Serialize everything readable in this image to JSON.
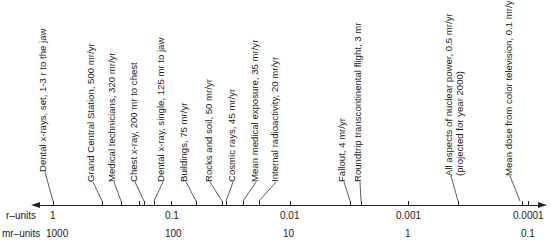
{
  "axis": {
    "r_units_label": "r–units",
    "mr_units_label": "mr–units",
    "r_ticks": [
      "1",
      "0.1",
      "0.01",
      "0.001",
      "0.0001"
    ],
    "mr_ticks": [
      "1000",
      "100",
      "10",
      "1",
      "0.1"
    ]
  },
  "annotations": [
    {
      "text": "Dental x-rays, set, 1-3 r to the jaw"
    },
    {
      "text": "Grand Central Station, 500 mr/yr"
    },
    {
      "text": "Medical technicians, 320 mr/yr"
    },
    {
      "text": "Chest x-ray, 200 mr to chest"
    },
    {
      "text": "Dental x-ray, single, 125 mr to jaw"
    },
    {
      "text": "Buildings, 75 mr/yr"
    },
    {
      "text": "Rocks and soil, 50 mr/yr"
    },
    {
      "text": "Cosmic rays, 45 mr/yr"
    },
    {
      "text": "Mean medical exposure, 35 mr/yr"
    },
    {
      "text": "Internal radioactivity, 20 mr/yr"
    },
    {
      "text": "Fallout, 4 mr/yr"
    },
    {
      "text": "Roundtrip transcontinental flight, 3 mr"
    },
    {
      "text": "All aspects of nuclear power, 0.5 mr/yr"
    },
    {
      "text": "(projected for year 2000)"
    },
    {
      "text": "Mean dose from color television, 0.1 mr/yr"
    }
  ]
}
